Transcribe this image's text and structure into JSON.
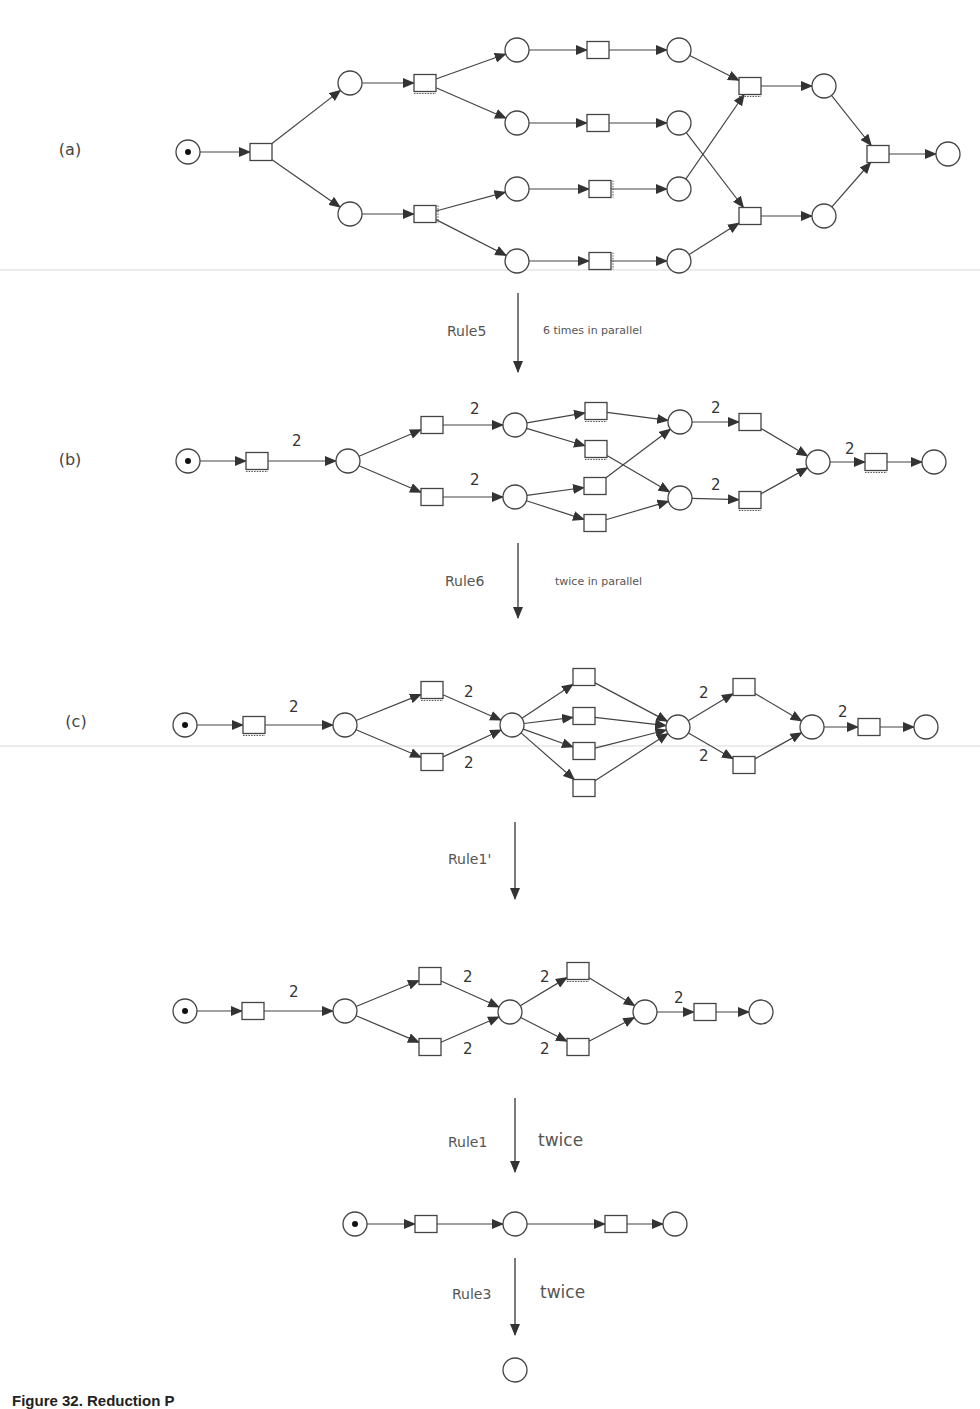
{
  "figure": {
    "caption": "Figure 32. Reduction P",
    "colors": {
      "stroke": "#444444",
      "token": "#111111",
      "background": "#ffffff"
    }
  },
  "steps": [
    {
      "rule": "Rule5",
      "note": "6 times in parallel",
      "note_size": "small"
    },
    {
      "rule": "Rule6",
      "note": "twice in parallel",
      "note_size": "small"
    },
    {
      "rule": "Rule1'",
      "note": "",
      "note_size": "small"
    },
    {
      "rule": "Rule1",
      "note": "twice",
      "note_size": "big"
    },
    {
      "rule": "Rule3",
      "note": "twice",
      "note_size": "big"
    }
  ],
  "nets": [
    {
      "id": "a",
      "label": "(a)",
      "label_pos": [
        70,
        155
      ],
      "places": [
        {
          "id": "p0",
          "x": 188,
          "y": 152,
          "token": true
        },
        {
          "id": "p1",
          "x": 350,
          "y": 83
        },
        {
          "id": "p2",
          "x": 350,
          "y": 214
        },
        {
          "id": "p3",
          "x": 517,
          "y": 50
        },
        {
          "id": "p4",
          "x": 517,
          "y": 123
        },
        {
          "id": "p5",
          "x": 517,
          "y": 189
        },
        {
          "id": "p6",
          "x": 517,
          "y": 261
        },
        {
          "id": "p7",
          "x": 679,
          "y": 50
        },
        {
          "id": "p8",
          "x": 679,
          "y": 123
        },
        {
          "id": "p9",
          "x": 679,
          "y": 189
        },
        {
          "id": "p10",
          "x": 679,
          "y": 261
        },
        {
          "id": "p11",
          "x": 824,
          "y": 86
        },
        {
          "id": "p12",
          "x": 824,
          "y": 216
        },
        {
          "id": "p13",
          "x": 948,
          "y": 154
        }
      ],
      "transitions": [
        {
          "id": "t0",
          "x": 261,
          "y": 152
        },
        {
          "id": "t1",
          "x": 425,
          "y": 83,
          "dotted": "bottom"
        },
        {
          "id": "t2",
          "x": 425,
          "y": 214,
          "dotted": "right"
        },
        {
          "id": "t3",
          "x": 598,
          "y": 50
        },
        {
          "id": "t4",
          "x": 598,
          "y": 123
        },
        {
          "id": "t5",
          "x": 600,
          "y": 189,
          "dotted": "right"
        },
        {
          "id": "t6",
          "x": 600,
          "y": 261,
          "dotted": "right"
        },
        {
          "id": "t7",
          "x": 750,
          "y": 86,
          "dotted": "bottom"
        },
        {
          "id": "t8",
          "x": 750,
          "y": 216
        },
        {
          "id": "t9",
          "x": 878,
          "y": 154
        }
      ],
      "arcs": [
        [
          "p0",
          "t0"
        ],
        [
          "t0",
          "p1"
        ],
        [
          "t0",
          "p2"
        ],
        [
          "p1",
          "t1"
        ],
        [
          "p2",
          "t2"
        ],
        [
          "t1",
          "p3"
        ],
        [
          "t1",
          "p4"
        ],
        [
          "t2",
          "p5"
        ],
        [
          "t2",
          "p6"
        ],
        [
          "p3",
          "t3"
        ],
        [
          "p4",
          "t4"
        ],
        [
          "p5",
          "t5"
        ],
        [
          "p6",
          "t6"
        ],
        [
          "t3",
          "p7"
        ],
        [
          "t4",
          "p8"
        ],
        [
          "t5",
          "p9"
        ],
        [
          "t6",
          "p10"
        ],
        [
          "p7",
          "t7"
        ],
        [
          "p9",
          "t7"
        ],
        [
          "p8",
          "t8"
        ],
        [
          "p10",
          "t8"
        ],
        [
          "t7",
          "p11"
        ],
        [
          "t8",
          "p12"
        ],
        [
          "p11",
          "t9"
        ],
        [
          "p12",
          "t9"
        ],
        [
          "t9",
          "p13"
        ]
      ],
      "weights": []
    },
    {
      "id": "b",
      "label": "(b)",
      "label_pos": [
        70,
        465
      ],
      "places": [
        {
          "id": "p0",
          "x": 188,
          "y": 461,
          "token": true
        },
        {
          "id": "p1",
          "x": 348,
          "y": 461
        },
        {
          "id": "p2",
          "x": 515,
          "y": 425
        },
        {
          "id": "p3",
          "x": 515,
          "y": 497
        },
        {
          "id": "p4",
          "x": 680,
          "y": 422
        },
        {
          "id": "p5",
          "x": 680,
          "y": 498
        },
        {
          "id": "p6",
          "x": 818,
          "y": 462
        },
        {
          "id": "p7",
          "x": 934,
          "y": 462
        }
      ],
      "transitions": [
        {
          "id": "t0",
          "x": 257,
          "y": 461,
          "dotted": "bottom"
        },
        {
          "id": "t1",
          "x": 432,
          "y": 425
        },
        {
          "id": "t2",
          "x": 432,
          "y": 497
        },
        {
          "id": "t3",
          "x": 596,
          "y": 411,
          "dotted": "bottom"
        },
        {
          "id": "t4",
          "x": 596,
          "y": 449,
          "dotted": "bottom"
        },
        {
          "id": "t5",
          "x": 595,
          "y": 486
        },
        {
          "id": "t6",
          "x": 595,
          "y": 523
        },
        {
          "id": "t7",
          "x": 750,
          "y": 422
        },
        {
          "id": "t8",
          "x": 750,
          "y": 500,
          "dotted": "bottom"
        },
        {
          "id": "t9",
          "x": 876,
          "y": 462,
          "dotted": "bottom"
        }
      ],
      "arcs": [
        [
          "p0",
          "t0"
        ],
        [
          "t0",
          "p1"
        ],
        [
          "p1",
          "t1"
        ],
        [
          "p1",
          "t2"
        ],
        [
          "t1",
          "p2"
        ],
        [
          "t2",
          "p3"
        ],
        [
          "p2",
          "t3"
        ],
        [
          "p2",
          "t4"
        ],
        [
          "p3",
          "t5"
        ],
        [
          "p3",
          "t6"
        ],
        [
          "t3",
          "p4"
        ],
        [
          "t5",
          "p4"
        ],
        [
          "t4",
          "p5"
        ],
        [
          "t6",
          "p5"
        ],
        [
          "p4",
          "t7"
        ],
        [
          "p5",
          "t8"
        ],
        [
          "t7",
          "p6"
        ],
        [
          "t8",
          "p6"
        ],
        [
          "p6",
          "t9"
        ],
        [
          "t9",
          "p7"
        ]
      ],
      "weights": [
        {
          "text": "2",
          "x": 292,
          "y": 446
        },
        {
          "text": "2",
          "x": 470,
          "y": 414
        },
        {
          "text": "2",
          "x": 470,
          "y": 485
        },
        {
          "text": "2",
          "x": 711,
          "y": 413
        },
        {
          "text": "2",
          "x": 711,
          "y": 490
        },
        {
          "text": "2",
          "x": 845,
          "y": 454
        }
      ]
    },
    {
      "id": "c",
      "label": "(c)",
      "label_pos": [
        76,
        727
      ],
      "places": [
        {
          "id": "p0",
          "x": 185,
          "y": 725,
          "token": true
        },
        {
          "id": "p1",
          "x": 345,
          "y": 725
        },
        {
          "id": "p2",
          "x": 512,
          "y": 725
        },
        {
          "id": "p3",
          "x": 678,
          "y": 727
        },
        {
          "id": "p4",
          "x": 812,
          "y": 727
        },
        {
          "id": "p5",
          "x": 926,
          "y": 727
        }
      ],
      "transitions": [
        {
          "id": "t0",
          "x": 254,
          "y": 725,
          "dotted": "bottom"
        },
        {
          "id": "t1",
          "x": 432,
          "y": 690,
          "dotted": "bottom"
        },
        {
          "id": "t2",
          "x": 432,
          "y": 762
        },
        {
          "id": "t3",
          "x": 584,
          "y": 677
        },
        {
          "id": "t4",
          "x": 584,
          "y": 716
        },
        {
          "id": "t5",
          "x": 584,
          "y": 751
        },
        {
          "id": "t6",
          "x": 584,
          "y": 788
        },
        {
          "id": "t7",
          "x": 744,
          "y": 687
        },
        {
          "id": "t8",
          "x": 744,
          "y": 765
        },
        {
          "id": "t9",
          "x": 869,
          "y": 727
        }
      ],
      "arcs": [
        [
          "p0",
          "t0"
        ],
        [
          "t0",
          "p1"
        ],
        [
          "p1",
          "t1"
        ],
        [
          "p1",
          "t2"
        ],
        [
          "t1",
          "p2"
        ],
        [
          "t2",
          "p2"
        ],
        [
          "p2",
          "t3"
        ],
        [
          "p2",
          "t4"
        ],
        [
          "p2",
          "t5"
        ],
        [
          "p2",
          "t6"
        ],
        [
          "t3",
          "p3"
        ],
        [
          "t4",
          "p3"
        ],
        [
          "t5",
          "p3"
        ],
        [
          "t6",
          "p3"
        ],
        [
          "p3",
          "t7"
        ],
        [
          "p3",
          "t8"
        ],
        [
          "t7",
          "p4"
        ],
        [
          "t8",
          "p4"
        ],
        [
          "p4",
          "t9"
        ],
        [
          "t9",
          "p5"
        ]
      ],
      "weights": [
        {
          "text": "2",
          "x": 289,
          "y": 712
        },
        {
          "text": "2",
          "x": 464,
          "y": 697
        },
        {
          "text": "2",
          "x": 464,
          "y": 768
        },
        {
          "text": "2",
          "x": 699,
          "y": 698
        },
        {
          "text": "2",
          "x": 699,
          "y": 761
        },
        {
          "text": "2",
          "x": 838,
          "y": 717
        }
      ]
    },
    {
      "id": "d",
      "label": "",
      "label_pos": [
        0,
        0
      ],
      "places": [
        {
          "id": "p0",
          "x": 185,
          "y": 1011,
          "token": true
        },
        {
          "id": "p1",
          "x": 345,
          "y": 1011
        },
        {
          "id": "p2",
          "x": 510,
          "y": 1012
        },
        {
          "id": "p3",
          "x": 645,
          "y": 1012
        },
        {
          "id": "p4",
          "x": 761,
          "y": 1012
        }
      ],
      "transitions": [
        {
          "id": "t0",
          "x": 253,
          "y": 1011
        },
        {
          "id": "t1",
          "x": 430,
          "y": 976
        },
        {
          "id": "t2",
          "x": 430,
          "y": 1047
        },
        {
          "id": "t3",
          "x": 578,
          "y": 971,
          "dotted": "bottom"
        },
        {
          "id": "t4",
          "x": 578,
          "y": 1047
        },
        {
          "id": "t5",
          "x": 705,
          "y": 1012
        }
      ],
      "arcs": [
        [
          "p0",
          "t0"
        ],
        [
          "t0",
          "p1"
        ],
        [
          "p1",
          "t1"
        ],
        [
          "p1",
          "t2"
        ],
        [
          "t1",
          "p2"
        ],
        [
          "t2",
          "p2"
        ],
        [
          "p2",
          "t3"
        ],
        [
          "p2",
          "t4"
        ],
        [
          "t3",
          "p3"
        ],
        [
          "t4",
          "p3"
        ],
        [
          "p3",
          "t5"
        ],
        [
          "t5",
          "p4"
        ]
      ],
      "weights": [
        {
          "text": "2",
          "x": 289,
          "y": 997
        },
        {
          "text": "2",
          "x": 463,
          "y": 982
        },
        {
          "text": "2",
          "x": 463,
          "y": 1054
        },
        {
          "text": "2",
          "x": 540,
          "y": 982
        },
        {
          "text": "2",
          "x": 540,
          "y": 1054
        },
        {
          "text": "2",
          "x": 674,
          "y": 1003
        }
      ]
    },
    {
      "id": "e",
      "label": "",
      "label_pos": [
        0,
        0
      ],
      "places": [
        {
          "id": "p0",
          "x": 355,
          "y": 1224,
          "token": true
        },
        {
          "id": "p1",
          "x": 515,
          "y": 1224
        },
        {
          "id": "p2",
          "x": 675,
          "y": 1224
        }
      ],
      "transitions": [
        {
          "id": "t0",
          "x": 426,
          "y": 1224
        },
        {
          "id": "t1",
          "x": 616,
          "y": 1224
        }
      ],
      "arcs": [
        [
          "p0",
          "t0"
        ],
        [
          "t0",
          "p1"
        ],
        [
          "p1",
          "t1"
        ],
        [
          "t1",
          "p2"
        ]
      ],
      "weights": []
    },
    {
      "id": "f",
      "label": "",
      "label_pos": [
        0,
        0
      ],
      "places": [
        {
          "id": "p0",
          "x": 515,
          "y": 1370
        }
      ],
      "transitions": [],
      "arcs": [],
      "weights": []
    }
  ],
  "step_arrows": [
    {
      "x": 518,
      "y1": 293,
      "y2": 372,
      "label_x": 447,
      "label_y": 336,
      "note_x": 543,
      "note_y": 334
    },
    {
      "x": 518,
      "y1": 543,
      "y2": 618,
      "label_x": 445,
      "label_y": 586,
      "note_x": 555,
      "note_y": 585
    },
    {
      "x": 515,
      "y1": 822,
      "y2": 899,
      "label_x": 448,
      "label_y": 864,
      "note_x": 0,
      "note_y": 0
    },
    {
      "x": 515,
      "y1": 1098,
      "y2": 1172,
      "label_x": 448,
      "label_y": 1147,
      "note_x": 538,
      "note_y": 1146
    },
    {
      "x": 515,
      "y1": 1258,
      "y2": 1335,
      "label_x": 452,
      "label_y": 1299,
      "note_x": 540,
      "note_y": 1298
    }
  ],
  "scanlines": [
    270,
    746
  ]
}
